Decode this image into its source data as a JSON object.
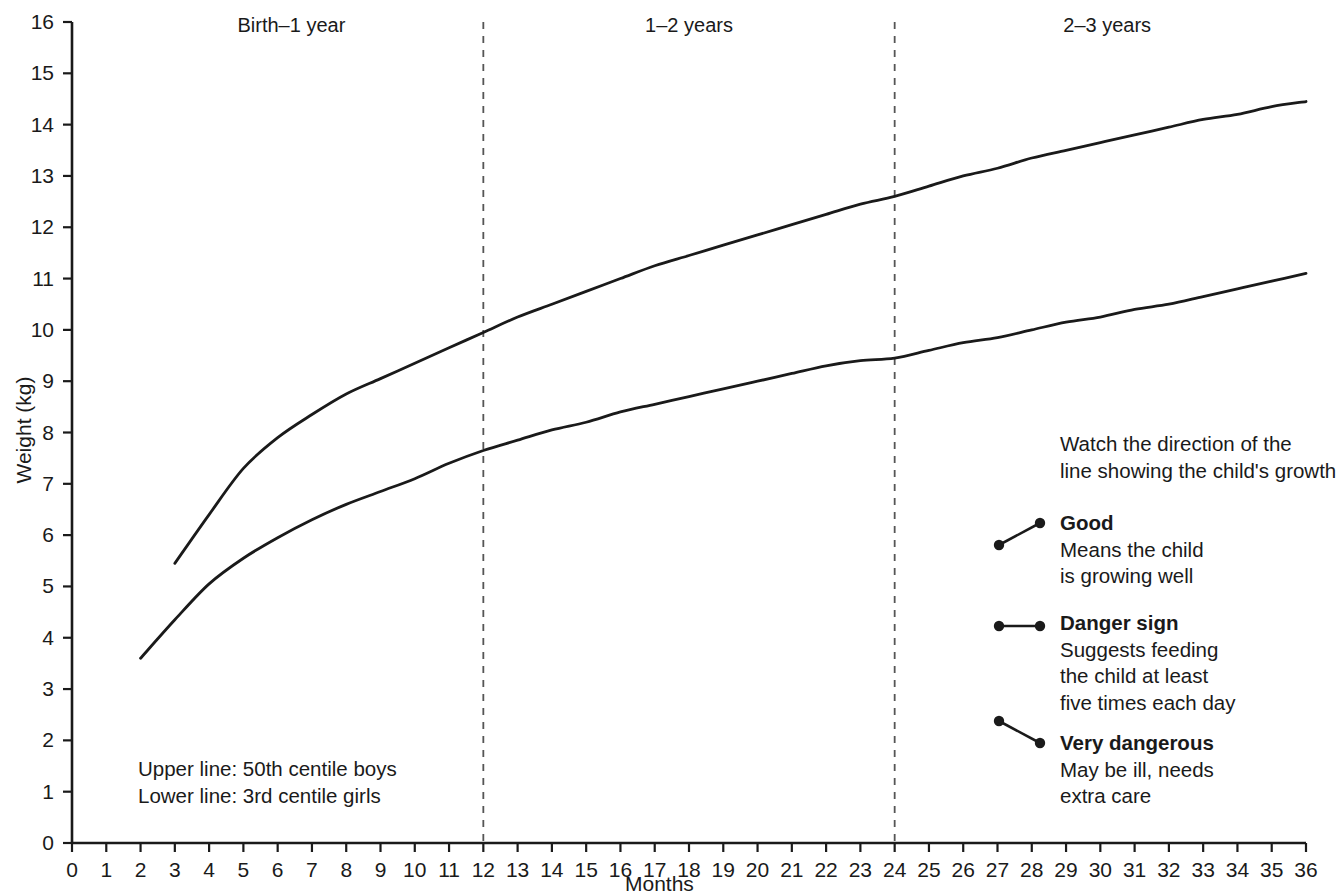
{
  "chart_data": {
    "type": "line",
    "title": "",
    "xlabel": "Months",
    "ylabel": "Weight (kg)",
    "xlim": [
      0,
      36
    ],
    "ylim": [
      0,
      16
    ],
    "grid": false,
    "legend_position": "right",
    "x_ticks": [
      "0",
      "1",
      "2",
      "3",
      "4",
      "5",
      "6",
      "7",
      "8",
      "9",
      "10",
      "11",
      "12",
      "13",
      "14",
      "15",
      "16",
      "17",
      "18",
      "19",
      "20",
      "21",
      "22",
      "23",
      "24",
      "25",
      "26",
      "27",
      "28",
      "29",
      "30",
      "31",
      "32",
      "33",
      "34",
      "35",
      "36"
    ],
    "y_ticks": [
      "0",
      "1",
      "2",
      "3",
      "4",
      "5",
      "6",
      "7",
      "8",
      "9",
      "10",
      "11",
      "12",
      "13",
      "14",
      "15",
      "16"
    ],
    "series": [
      {
        "name": "50th centile boys",
        "note": "Upper line",
        "x": [
          3,
          4,
          5,
          6,
          7,
          8,
          9,
          10,
          11,
          12,
          13,
          14,
          15,
          16,
          17,
          18,
          19,
          20,
          21,
          22,
          23,
          24,
          25,
          26,
          27,
          28,
          29,
          30,
          31,
          32,
          33,
          34,
          35,
          36
        ],
        "y": [
          5.45,
          6.4,
          7.3,
          7.9,
          8.35,
          8.75,
          9.05,
          9.35,
          9.65,
          9.95,
          10.25,
          10.5,
          10.75,
          11.0,
          11.25,
          11.45,
          11.65,
          11.85,
          12.05,
          12.25,
          12.45,
          12.6,
          12.8,
          13.0,
          13.15,
          13.35,
          13.5,
          13.65,
          13.8,
          13.95,
          14.1,
          14.2,
          14.35,
          14.45
        ]
      },
      {
        "name": "3rd centile girls",
        "note": "Lower line",
        "x": [
          2,
          3,
          4,
          5,
          6,
          7,
          8,
          9,
          10,
          11,
          12,
          13,
          14,
          15,
          16,
          17,
          18,
          19,
          20,
          21,
          22,
          23,
          24,
          25,
          26,
          27,
          28,
          29,
          30,
          31,
          32,
          33,
          34,
          35,
          36
        ],
        "y": [
          3.6,
          4.35,
          5.05,
          5.55,
          5.95,
          6.3,
          6.6,
          6.85,
          7.1,
          7.4,
          7.65,
          7.85,
          8.05,
          8.2,
          8.4,
          8.55,
          8.7,
          8.85,
          9.0,
          9.15,
          9.3,
          9.4,
          9.45,
          9.6,
          9.75,
          9.85,
          10.0,
          10.15,
          10.25,
          10.4,
          10.5,
          10.65,
          10.8,
          10.95,
          11.1
        ]
      }
    ],
    "period_dividers": [
      12,
      24
    ],
    "period_labels": [
      {
        "label": "Birth–1 year",
        "center_month": 6.4
      },
      {
        "label": "1–2 years",
        "center_month": 18.0
      },
      {
        "label": "2–3 years",
        "center_month": 30.2
      }
    ],
    "annotations": [
      "Upper line: 50th centile boys",
      "Lower line: 3rd centile girls"
    ]
  },
  "axes": {
    "y_title": "Weight (kg)",
    "x_title": "Months"
  },
  "periods": [
    {
      "label": "Birth–1 year"
    },
    {
      "label": "1–2 years"
    },
    {
      "label": "2–3 years"
    }
  ],
  "notes": {
    "line1": "Upper line: 50th centile boys",
    "line2": "Lower line: 3rd centile girls"
  },
  "legend": {
    "intro_line1": "Watch the direction of the",
    "intro_line2": "line showing the child's growth",
    "items": [
      {
        "title": "Good",
        "desc_line1": "Means the child",
        "desc_line2": "is growing well",
        "desc_line3": "",
        "marker": "rising-line-marker"
      },
      {
        "title": "Danger sign",
        "desc_line1": "Suggests feeding",
        "desc_line2": "the child at least",
        "desc_line3": "five times each day",
        "marker": "flat-line-marker"
      },
      {
        "title": "Very dangerous",
        "desc_line1": "May be ill, needs",
        "desc_line2": "extra care",
        "desc_line3": "",
        "marker": "falling-line-marker"
      }
    ]
  },
  "colors": {
    "axis": "#1a1a1a",
    "curve": "#1a1a1a",
    "divider": "#555555",
    "text": "#1a1a1a",
    "background": "#ffffff"
  }
}
